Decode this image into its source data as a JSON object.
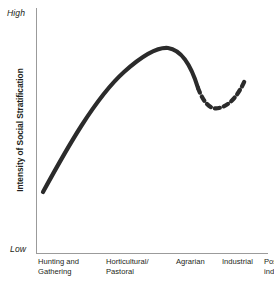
{
  "chart_data": {
    "type": "line",
    "title": "",
    "xlabel": "",
    "ylabel": "Intensity of Social Stratification",
    "categories": [
      "Hunting and\nGathering",
      "Horticultural/\nPastoral",
      "Agrarian",
      "Industrial",
      "Post-\nindustrial"
    ],
    "y_axis_scale_labels": {
      "high": "High",
      "low": "Low"
    },
    "ylim": [
      0,
      100
    ],
    "grid": false,
    "legend": "none",
    "series": [
      {
        "name": "Intensity of Social Stratification",
        "style": "solid",
        "color": "#2b2b2b",
        "points": [
          {
            "x": "Hunting and Gathering",
            "y": 24
          },
          {
            "x": "Horticultural/Pastoral",
            "y": 62
          },
          {
            "x": "Agrarian",
            "y": 97
          },
          {
            "x": "Industrial",
            "y": 66
          }
        ]
      },
      {
        "name": "Projected trend",
        "style": "dashed",
        "color": "#2b2b2b",
        "points": [
          {
            "x": "Industrial",
            "y": 66
          },
          {
            "x": "Industrial-late",
            "y": 56
          },
          {
            "x": "Post-industrial",
            "y": 70
          }
        ]
      }
    ],
    "curve_geometry": {
      "solid_path": "M43,192 C66,150 95,98 124,72 C143,55 157,47 168,48 C182,50 191,65 198,88",
      "dashed_path": "M198,88 C204,104 211,110 219,108 C229,106 238,96 245,80",
      "stroke_width": 4.2,
      "dash_pattern": "5,4.2"
    },
    "colors": {
      "curve": "#2b2b2b",
      "axis": "#9b9b9b",
      "text": "#231f20",
      "background": "#ffffff"
    }
  }
}
